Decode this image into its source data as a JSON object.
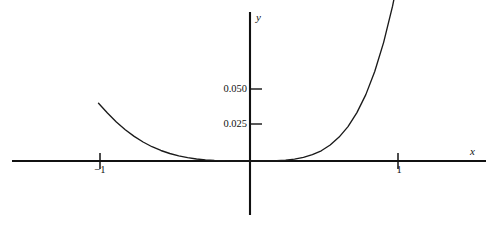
{
  "chart_data": {
    "type": "line",
    "title": "",
    "xlabel": "x",
    "ylabel": "y",
    "xlim": [
      -1.6,
      1.58
    ],
    "ylim": [
      -0.0375,
      0.1035
    ],
    "grid": false,
    "legend": null,
    "axis_style": "centered-cross",
    "xticks": [
      -1,
      1
    ],
    "xtick_labels": [
      "−1",
      "1"
    ],
    "yticks": [
      0.025,
      0.05
    ],
    "ytick_labels": [
      "0.025",
      "0.050"
    ],
    "series": [
      {
        "name": "curve",
        "color": "#1a1a1a",
        "x": [
          -1.02,
          -0.96,
          -0.9,
          -0.84,
          -0.78,
          -0.72,
          -0.66,
          -0.6,
          -0.54,
          -0.48,
          -0.42,
          -0.36,
          -0.3,
          -0.24,
          -0.18,
          -0.12,
          -0.06,
          0.0,
          0.06,
          0.12,
          0.18,
          0.24,
          0.3,
          0.36,
          0.42,
          0.48,
          0.54,
          0.6,
          0.66,
          0.72,
          0.78,
          0.84,
          0.9,
          0.96,
          1.02
        ],
        "y": [
          0.0401,
          0.0333,
          0.0271,
          0.0217,
          0.0171,
          0.0132,
          0.0099,
          0.0073,
          0.0052,
          0.0035,
          0.0023,
          0.0014,
          0.0008,
          0.0004,
          0.00015,
          3e-05,
          0.0,
          0.0,
          0.0,
          4e-05,
          0.0002,
          0.0006,
          0.0013,
          0.0025,
          0.0044,
          0.0071,
          0.0111,
          0.0166,
          0.0239,
          0.0336,
          0.0461,
          0.0622,
          0.0824,
          0.1075,
          0.1384
        ]
      }
    ]
  },
  "labels": {
    "ytick_050": "0.050",
    "ytick_025": "0.025",
    "xtick_neg1": "−1",
    "xtick_pos1": "1",
    "axis_x": "x",
    "axis_y": "y"
  },
  "geometry": {
    "x_axis_y_px": 161,
    "y_axis_x_px": 250,
    "x_axis_left_px": 12,
    "x_axis_right_px": 486,
    "y_axis_top_px": 12,
    "y_axis_bottom_px": 215,
    "px_per_x_unit": 148.5,
    "px_per_y_unit": 1440
  },
  "colors": {
    "background": "#ffffff",
    "axis": "#111111",
    "curve": "#1a1a1a",
    "text": "#111111"
  }
}
